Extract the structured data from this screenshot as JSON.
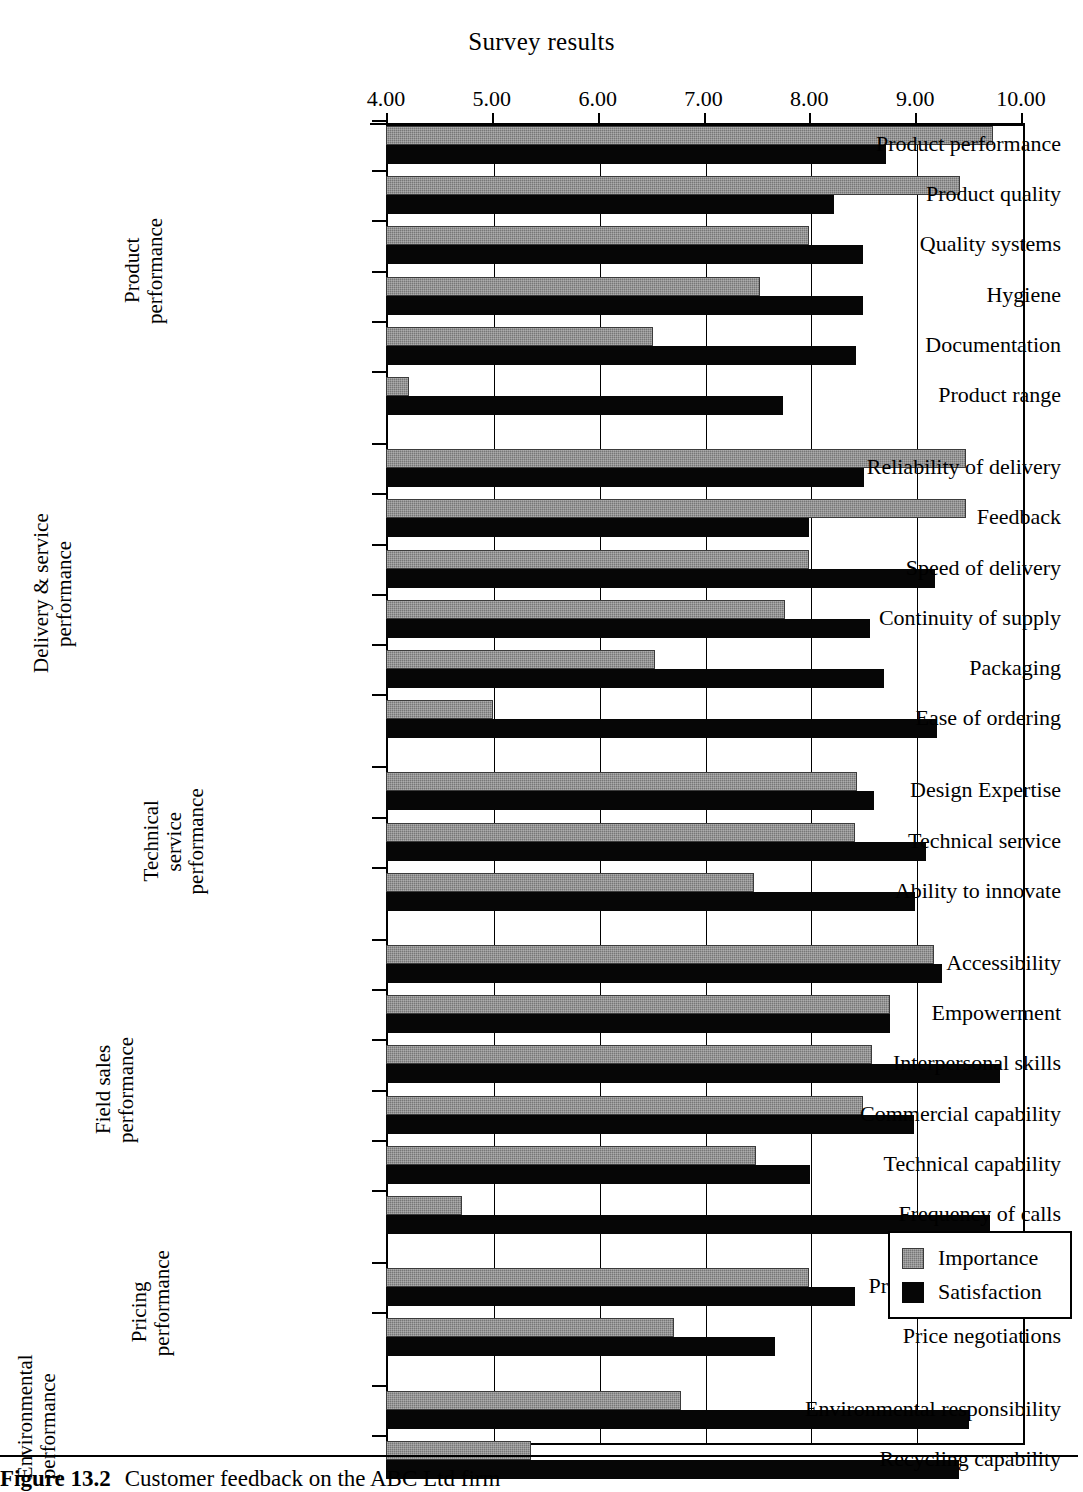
{
  "chart_data": {
    "type": "bar",
    "orientation": "horizontal",
    "title": "Survey results",
    "xlabel": "",
    "ylabel": "",
    "xlim": [
      4.0,
      10.0
    ],
    "xticks": [
      "4.00",
      "5.00",
      "6.00",
      "7.00",
      "8.00",
      "9.00",
      "10.00"
    ],
    "xtick_values": [
      4,
      5,
      6,
      7,
      8,
      9,
      10
    ],
    "grid": true,
    "legend_position": "bottom-right",
    "series": [
      {
        "name": "Importance",
        "color": "#777777",
        "values": [
          9.74,
          9.42,
          8.0,
          7.53,
          6.52,
          4.22,
          9.48,
          9.48,
          8.0,
          7.77,
          6.54,
          5.01,
          8.45,
          8.43,
          7.48,
          9.18,
          8.76,
          8.59,
          8.51,
          7.5,
          4.72,
          8.0,
          6.72,
          6.79,
          5.37
        ]
      },
      {
        "name": "Satisfaction",
        "color": "#060606",
        "values": [
          8.72,
          8.23,
          8.51,
          8.51,
          8.44,
          7.75,
          8.52,
          8.0,
          9.19,
          8.57,
          8.71,
          9.21,
          8.61,
          9.1,
          9.0,
          9.25,
          8.76,
          9.8,
          8.99,
          8.01,
          9.71,
          8.43,
          7.68,
          9.51,
          9.41
        ]
      }
    ],
    "categories": [
      "Product performance",
      "Product quality",
      "Quality systems",
      "Hygiene",
      "Documentation",
      "Product range",
      "Reliability of delivery",
      "Feedback",
      "Speed of delivery",
      "Continuity of supply",
      "Packaging",
      "Ease of ordering",
      "Design Expertise",
      "Technical service",
      "Ability to innovate",
      "Accessibility",
      "Empowerment",
      "Interpersonal skills",
      "Commercial capability",
      "Technical capability",
      "Frequency of calls",
      "Price competitiveness",
      "Price negotiations",
      "Environmental responsibility",
      "Recycling capability"
    ],
    "groups": [
      {
        "label": "Product\nperformance",
        "start": 0,
        "count": 6
      },
      {
        "label": "Delivery & service\nperformance",
        "start": 6,
        "count": 6
      },
      {
        "label": "Technical service\nperformance",
        "start": 12,
        "count": 3
      },
      {
        "label": "Field sales\nperformance",
        "start": 15,
        "count": 6
      },
      {
        "label": "Pricing\nperformance",
        "start": 21,
        "count": 2
      },
      {
        "label": "Environmental\nperformance",
        "start": 23,
        "count": 2
      }
    ]
  },
  "legend": {
    "items": [
      {
        "label": "Importance",
        "color": "#777777"
      },
      {
        "label": "Satisfaction",
        "color": "#060606"
      }
    ]
  },
  "caption": {
    "figure_number": "Figure 13.2",
    "text": "Customer feedback on the ABC Ltd firm"
  }
}
